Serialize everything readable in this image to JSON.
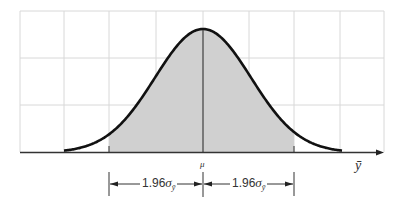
{
  "figure": {
    "axis_label": "ȳ",
    "center_label": "μ",
    "left_interval": {
      "coef": "1.96",
      "symbol": "σ",
      "subscript": "ȳ"
    },
    "right_interval": {
      "coef": "1.96",
      "symbol": "σ",
      "subscript": "ȳ"
    },
    "colors": {
      "grid": "#d8d8d8",
      "curve": "#111111",
      "shade": "#d0d0d0",
      "axis": "#333333"
    }
  },
  "chart_data": {
    "type": "area",
    "title": "",
    "xlabel": "ȳ",
    "ylabel": "",
    "curve": "normal density",
    "mean_label": "μ",
    "shaded_region": {
      "from": "μ - 1.96σ_ȳ",
      "to": "μ + 1.96σ_ȳ"
    },
    "annotations": [
      "1.96σ_ȳ",
      "1.96σ_ȳ"
    ],
    "grid": true,
    "grid_columns": 8,
    "grid_rows": 3
  }
}
